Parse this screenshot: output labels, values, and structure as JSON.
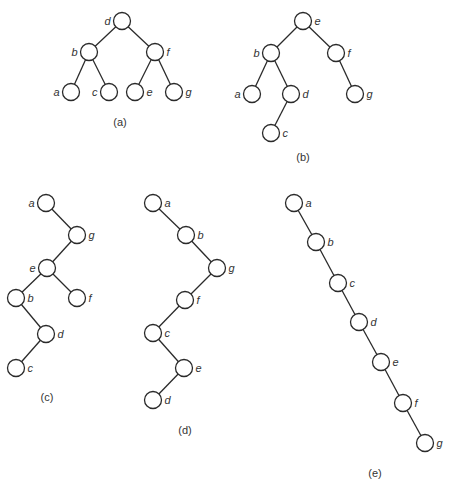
{
  "figure": {
    "type": "binary-search-trees",
    "node_radius": 8.5,
    "colors": {
      "stroke": "#2a2a2a",
      "text": "#333333",
      "background": "#ffffff"
    },
    "trees": [
      {
        "id": "a",
        "caption": "(a)",
        "caption_pos": [
          120,
          126
        ],
        "nodes": [
          {
            "key": "d",
            "x": 122,
            "y": 21,
            "label_side": "left"
          },
          {
            "key": "b",
            "x": 89,
            "y": 52,
            "label_side": "left"
          },
          {
            "key": "f",
            "x": 155,
            "y": 52,
            "label_side": "right"
          },
          {
            "key": "a",
            "x": 71,
            "y": 92,
            "label_side": "left"
          },
          {
            "key": "c",
            "x": 109,
            "y": 92,
            "label_side": "left"
          },
          {
            "key": "e",
            "x": 135,
            "y": 92,
            "label_side": "right"
          },
          {
            "key": "g",
            "x": 174,
            "y": 92,
            "label_side": "right"
          }
        ],
        "edges": [
          [
            "d",
            "b"
          ],
          [
            "d",
            "f"
          ],
          [
            "b",
            "a"
          ],
          [
            "b",
            "c"
          ],
          [
            "f",
            "e"
          ],
          [
            "f",
            "g"
          ]
        ]
      },
      {
        "id": "b",
        "caption": "(b)",
        "caption_pos": [
          303,
          161
        ],
        "nodes": [
          {
            "key": "e",
            "x": 303,
            "y": 21,
            "label_side": "right"
          },
          {
            "key": "b",
            "x": 271,
            "y": 53,
            "label_side": "left"
          },
          {
            "key": "f",
            "x": 336,
            "y": 53,
            "label_side": "right"
          },
          {
            "key": "a",
            "x": 252,
            "y": 94,
            "label_side": "left"
          },
          {
            "key": "d",
            "x": 291,
            "y": 94,
            "label_side": "right"
          },
          {
            "key": "g",
            "x": 355,
            "y": 94,
            "label_side": "right"
          },
          {
            "key": "c",
            "x": 271,
            "y": 133,
            "label_side": "right"
          }
        ],
        "edges": [
          [
            "e",
            "b"
          ],
          [
            "e",
            "f"
          ],
          [
            "b",
            "a"
          ],
          [
            "b",
            "d"
          ],
          [
            "d",
            "c"
          ],
          [
            "f",
            "g"
          ]
        ]
      },
      {
        "id": "c",
        "caption": "(c)",
        "caption_pos": [
          47,
          401
        ],
        "nodes": [
          {
            "key": "a",
            "x": 46,
            "y": 203,
            "label_side": "left"
          },
          {
            "key": "g",
            "x": 77,
            "y": 235,
            "label_side": "right"
          },
          {
            "key": "e",
            "x": 47,
            "y": 268,
            "label_side": "left"
          },
          {
            "key": "b",
            "x": 16,
            "y": 298,
            "label_side": "right"
          },
          {
            "key": "f",
            "x": 77,
            "y": 298,
            "label_side": "right"
          },
          {
            "key": "d",
            "x": 46,
            "y": 334,
            "label_side": "right"
          },
          {
            "key": "c",
            "x": 16,
            "y": 368,
            "label_side": "right"
          }
        ],
        "edges": [
          [
            "a",
            "g"
          ],
          [
            "g",
            "e"
          ],
          [
            "e",
            "b"
          ],
          [
            "e",
            "f"
          ],
          [
            "b",
            "d"
          ],
          [
            "d",
            "c"
          ]
        ]
      },
      {
        "id": "d",
        "caption": "(d)",
        "caption_pos": [
          185,
          434
        ],
        "nodes": [
          {
            "key": "a",
            "x": 153,
            "y": 203,
            "label_side": "right"
          },
          {
            "key": "b",
            "x": 186,
            "y": 235,
            "label_side": "right"
          },
          {
            "key": "g",
            "x": 217,
            "y": 268,
            "label_side": "right"
          },
          {
            "key": "f",
            "x": 185,
            "y": 300,
            "label_side": "right"
          },
          {
            "key": "c",
            "x": 153,
            "y": 333,
            "label_side": "right"
          },
          {
            "key": "e",
            "x": 184,
            "y": 368,
            "label_side": "right"
          },
          {
            "key": "d",
            "x": 153,
            "y": 400,
            "label_side": "right"
          }
        ],
        "edges": [
          [
            "a",
            "b"
          ],
          [
            "b",
            "g"
          ],
          [
            "g",
            "f"
          ],
          [
            "f",
            "c"
          ],
          [
            "c",
            "e"
          ],
          [
            "e",
            "d"
          ]
        ]
      },
      {
        "id": "e",
        "caption": "(e)",
        "caption_pos": [
          375,
          477
        ],
        "nodes": [
          {
            "key": "a",
            "x": 294,
            "y": 203,
            "label_side": "right"
          },
          {
            "key": "b",
            "x": 316,
            "y": 242,
            "label_side": "right"
          },
          {
            "key": "c",
            "x": 338,
            "y": 283,
            "label_side": "right"
          },
          {
            "key": "d",
            "x": 359,
            "y": 322,
            "label_side": "right"
          },
          {
            "key": "e",
            "x": 381,
            "y": 362,
            "label_side": "right"
          },
          {
            "key": "f",
            "x": 403,
            "y": 403,
            "label_side": "right"
          },
          {
            "key": "g",
            "x": 425,
            "y": 443,
            "label_side": "right"
          }
        ],
        "edges": [
          [
            "a",
            "b"
          ],
          [
            "b",
            "c"
          ],
          [
            "c",
            "d"
          ],
          [
            "d",
            "e"
          ],
          [
            "e",
            "f"
          ],
          [
            "f",
            "g"
          ]
        ]
      }
    ]
  }
}
